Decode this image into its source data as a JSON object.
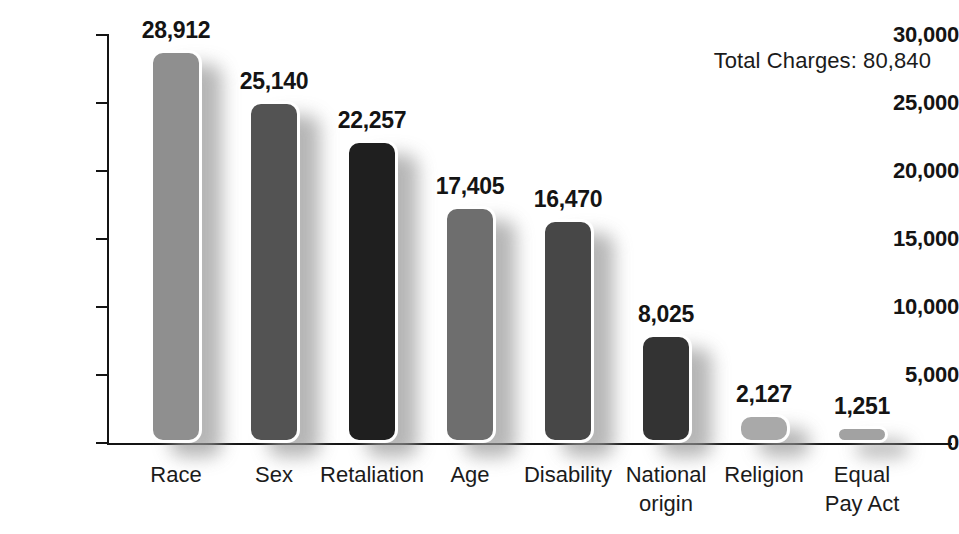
{
  "chart_data": {
    "type": "bar",
    "title": "",
    "subtitle": "",
    "xlabel": "",
    "ylabel": "",
    "ylim": [
      0,
      30000
    ],
    "grid": false,
    "legend": false,
    "orientation": "vertical",
    "categories": [
      "Race",
      "Sex",
      "Retaliation",
      "Age",
      "Disability",
      "National origin",
      "Religion",
      "Equal Pay Act"
    ],
    "category_labels_multiline": [
      "Race",
      "Sex",
      "Retaliation",
      "Age",
      "Disability",
      "National\norigin",
      "Religion",
      "Equal\nPay Act"
    ],
    "values": [
      28912,
      25140,
      22257,
      17405,
      16470,
      8025,
      2127,
      1251
    ],
    "value_labels": [
      "28,912",
      "25,140",
      "22,257",
      "17,405",
      "16,470",
      "8,025",
      "2,127",
      "1,251"
    ],
    "bar_colors": [
      "#8f8f8f",
      "#535353",
      "#1f1f1f",
      "#6e6e6e",
      "#474747",
      "#333333",
      "#a9a9a9",
      "#a2a2a2"
    ],
    "yticks": [
      0,
      5000,
      10000,
      15000,
      20000,
      25000,
      30000
    ],
    "ytick_labels": [
      "0",
      "5,000",
      "10,000",
      "15,000",
      "20,000",
      "25,000",
      "30,000"
    ],
    "annotations": [
      {
        "name": "total-charges",
        "text": "Total Charges: 80,840",
        "value": 80840,
        "position": "top-right"
      }
    ]
  },
  "style": {
    "background": "#ffffff",
    "axis_color": "#141414",
    "text_color": "#141414",
    "bar_outline": "#ffffff"
  }
}
